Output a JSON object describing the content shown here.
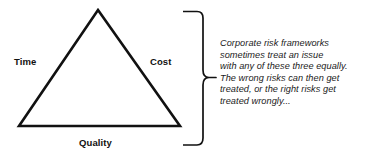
{
  "diagram": {
    "type": "triangle-with-brace-annotation",
    "background_color": "#ffffff",
    "stroke_color": "#111111",
    "triangle": {
      "name": "project-management-triangle",
      "vertices": {
        "apex": {
          "x": 98,
          "y": 10
        },
        "bottom_left": {
          "x": 19,
          "y": 126
        },
        "bottom_right": {
          "x": 180,
          "y": 126
        }
      },
      "stroke_width": 2.6
    },
    "labels": {
      "left": "Time",
      "right": "Cost",
      "bottom": "Quality"
    },
    "brace": {
      "name": "right-curly-brace",
      "orientation": "points-right",
      "top_y": 11,
      "bottom_y": 146,
      "spine_x": 203,
      "tip_x": 216,
      "tip_y": 78,
      "stroke_width": 1.6
    },
    "annotation": {
      "style": "italic",
      "lines": [
        "Corporate risk frameworks",
        "sometimes treat an issue",
        "with any of these three equally.",
        "The wrong risks can then get",
        "treated, or the right risks get",
        "treated wrongly..."
      ]
    }
  }
}
